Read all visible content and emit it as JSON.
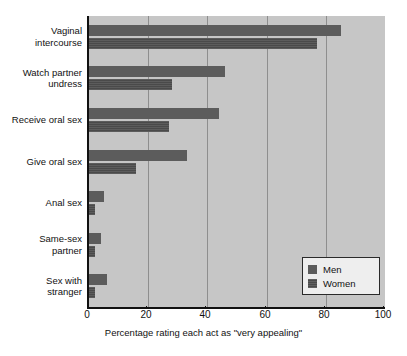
{
  "chart_data": {
    "type": "bar",
    "orientation": "horizontal",
    "title": "",
    "xlabel": "Percentage rating each act as \"very appealing\"",
    "ylabel": "",
    "xlim": [
      0,
      100
    ],
    "xticks": [
      0,
      20,
      40,
      60,
      80,
      100
    ],
    "grid": "vertical",
    "legend_position": "bottom-right",
    "categories": [
      "Vaginal\nintercourse",
      "Watch partner\nundress",
      "Receive oral sex",
      "Give oral sex",
      "Anal sex",
      "Same-sex\npartner",
      "Sex with\nstranger"
    ],
    "series": [
      {
        "name": "Men",
        "color": "#5c5c5c",
        "values": [
          85,
          46,
          44,
          33,
          5,
          4,
          6
        ]
      },
      {
        "name": "Women",
        "color": "#4a4a4a",
        "values": [
          77,
          28,
          27,
          16,
          2,
          2,
          2
        ]
      }
    ]
  },
  "legend": {
    "items": [
      {
        "label": "Men"
      },
      {
        "label": "Women"
      }
    ]
  },
  "axis": {
    "x_title": "Percentage rating each act as \"very appealing\"",
    "tick_labels": [
      "0",
      "20",
      "40",
      "60",
      "80",
      "100"
    ]
  },
  "colors": {
    "plot_background": "#c6c6c6",
    "gridline": "#8e8e8e",
    "axis": "#111111",
    "men_bar": "#5c5c5c",
    "women_bar": "#4a4a4a",
    "legend_background": "#eeeeee"
  }
}
